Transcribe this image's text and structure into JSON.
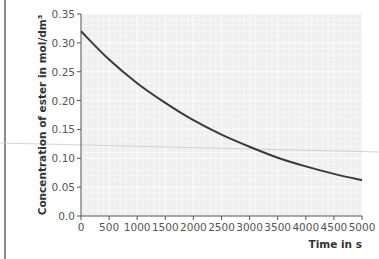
{
  "chart_data": {
    "type": "line",
    "title": "",
    "xlabel": "Time in s",
    "ylabel": "Concentration of ester in mol/dm³",
    "xlim": [
      0,
      5000
    ],
    "ylim": [
      0,
      0.35
    ],
    "x_ticks": [
      "0",
      "500",
      "1000",
      "1500",
      "2000",
      "2500",
      "3000",
      "3500",
      "4000",
      "4500",
      "5000"
    ],
    "y_ticks": [
      "0.0",
      "0.05",
      "0.10",
      "0.15",
      "0.20",
      "0.25",
      "0.30",
      "0.35"
    ],
    "grid": true,
    "legend": null,
    "series": [
      {
        "name": "Concentration of ester",
        "x": [
          0,
          500,
          1000,
          1500,
          2000,
          2500,
          3000,
          3500,
          4000,
          4500,
          5000
        ],
        "values": [
          0.32,
          0.271,
          0.23,
          0.196,
          0.166,
          0.141,
          0.12,
          0.101,
          0.086,
          0.073,
          0.062
        ]
      }
    ]
  },
  "colors": {
    "curve": "#3a3a3a",
    "plot_background": "#efefef",
    "gridline": "#fbfbfb",
    "axis": "#555555"
  }
}
